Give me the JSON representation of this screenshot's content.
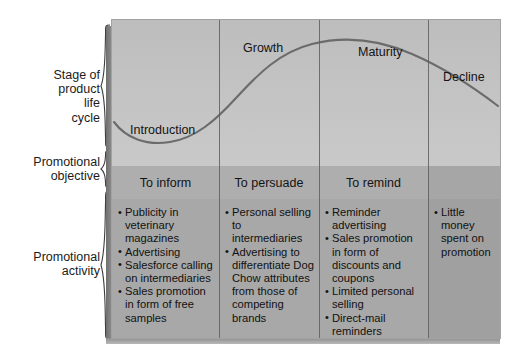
{
  "figure": {
    "edge_fragment": "g",
    "row_labels": [
      {
        "id": "stage-of-product-life-cycle",
        "text": "Stage of\nproduct\nlife\ncycle"
      },
      {
        "id": "promotional-objective",
        "text": "Promotional\nobjective"
      },
      {
        "id": "promotional-activity",
        "text": "Promotional\nactivity"
      }
    ],
    "stage_labels": [
      {
        "id": "introduction",
        "text": "Introduction"
      },
      {
        "id": "growth",
        "text": "Growth"
      },
      {
        "id": "maturity",
        "text": "Maturity"
      },
      {
        "id": "decline",
        "text": "Decline"
      }
    ],
    "objectives": [
      {
        "id": "to-inform",
        "text": "To inform"
      },
      {
        "id": "to-persuade",
        "text": "To persuade"
      },
      {
        "id": "to-remind",
        "text": "To remind"
      },
      {
        "id": "decline-objective",
        "text": ""
      }
    ],
    "activities": [
      {
        "id": "introduction-activities",
        "items": [
          "Publicity in veterinary magazines",
          "Advertising",
          "Salesforce calling on intermediaries",
          "Sales promotion in form of free samples"
        ]
      },
      {
        "id": "growth-activities",
        "items": [
          "Personal selling to intermediaries",
          "Advertising to differentiate Dog Chow attributes from those of competing brands"
        ]
      },
      {
        "id": "maturity-activities",
        "items": [
          "Reminder advertising",
          "Sales promotion in form of discounts and coupons",
          "Limited personal selling",
          "Direct-mail reminders"
        ]
      },
      {
        "id": "decline-activities",
        "items": [
          "Little money spent on promotion"
        ]
      }
    ],
    "colors": {
      "panel_top": "#c4c4c4",
      "panel_objective_row": "#aeaeae",
      "panel_activity_row": "#a8a8a8",
      "curve_line": "#6b6b6b",
      "divider": "#5e5e5e",
      "text": "#141414",
      "background": "#ffffff"
    }
  },
  "chart_data": {
    "type": "line",
    "xlabel": "",
    "ylabel": "",
    "categories": [
      "Introduction",
      "Growth",
      "Maturity",
      "Decline"
    ],
    "series": [
      {
        "name": "Sales",
        "x": [
          0,
          0.08,
          0.17,
          0.28,
          0.38,
          0.47,
          0.55,
          0.63,
          0.72,
          0.8,
          0.88,
          1.0
        ],
        "values": [
          0.3,
          0.18,
          0.12,
          0.22,
          0.42,
          0.62,
          0.78,
          0.88,
          0.93,
          0.92,
          0.84,
          0.66
        ]
      }
    ],
    "stage_boundaries": [
      0.276,
      0.533,
      0.814
    ],
    "grid": false,
    "legend": "none",
    "annotations": [
      {
        "text": "Introduction",
        "x": 0.1,
        "y": 0.28
      },
      {
        "text": "Growth",
        "x": 0.36,
        "y": 0.8
      },
      {
        "text": "Maturity",
        "x": 0.63,
        "y": 0.86
      },
      {
        "text": "Decline",
        "x": 0.9,
        "y": 0.63
      }
    ]
  }
}
